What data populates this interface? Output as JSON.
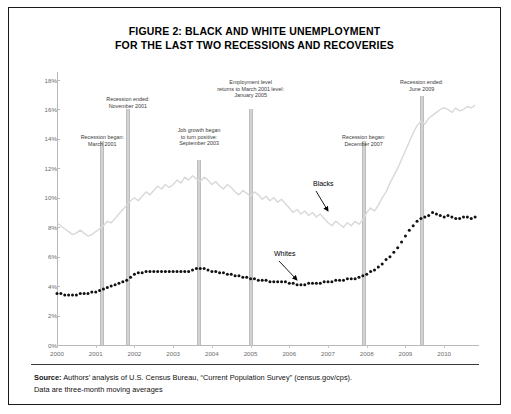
{
  "figure": {
    "title_line1": "FIGURE 2: BLACK AND WHITE UNEMPLOYMENT",
    "title_line2": "FOR THE LAST TWO RECESSIONS AND RECOVERIES",
    "source_label": "Source:",
    "source_text": " Authors’ analysis of U.S. Census Bureau, “Current Population Survey” (census.gov/cps).",
    "source_text_line2": "Data are three-month moving averages"
  },
  "annotations": [
    {
      "name": "recession-began-2001",
      "text_line1": "Recession began:",
      "text_line2": "March 2001",
      "x_year": 2001.17
    },
    {
      "name": "recession-ended-2001",
      "text_line1": "Recession ended:",
      "text_line2": "November 2001",
      "x_year": 2001.83
    },
    {
      "name": "job-growth-positive-2003",
      "text_line1": "Job growth began",
      "text_line2": "to turn positive:",
      "text_line3": "September 2003",
      "x_year": 2003.67
    },
    {
      "name": "employment-returns-2005",
      "text_line1": "Employment level",
      "text_line2": "returns to March 2001 level:",
      "text_line3": "January 2005",
      "x_year": 2005.0
    },
    {
      "name": "recession-began-2007",
      "text_line1": "Recession began:",
      "text_line2": "December 2007",
      "x_year": 2007.92
    },
    {
      "name": "recession-ended-2009",
      "text_line1": "Recession ended:",
      "text_line2": "June 2009",
      "x_year": 2009.42
    }
  ],
  "series_callouts": [
    {
      "name": "blacks",
      "label": "Blacks"
    },
    {
      "name": "whites",
      "label": "Whites"
    }
  ],
  "chart_data": {
    "type": "line",
    "title": "FIGURE 2: BLACK AND WHITE UNEMPLOYMENT FOR THE LAST TWO RECESSIONS AND RECOVERIES",
    "xlabel": "",
    "ylabel": "",
    "xlim": [
      2000,
      2010.9
    ],
    "ylim": [
      0,
      18
    ],
    "ytick_labels": [
      "0%",
      "2%",
      "4%",
      "6%",
      "8%",
      "10%",
      "12%",
      "14%",
      "16%",
      "18%"
    ],
    "ytick_values": [
      0,
      2,
      4,
      6,
      8,
      10,
      12,
      14,
      16,
      18
    ],
    "xtick_labels": [
      "2000",
      "2001",
      "2002",
      "2003",
      "2004",
      "2005",
      "2006",
      "2007",
      "2008",
      "2009",
      "2010"
    ],
    "xtick_values": [
      2000,
      2001,
      2002,
      2003,
      2004,
      2005,
      2006,
      2007,
      2008,
      2009,
      2010
    ],
    "grid": false,
    "legend_position": "inline-callout",
    "colors": {
      "blacks": "#d8d8d8",
      "whites": "#111111",
      "event_bar": "#d2d2d2",
      "axis": "#b9b9b9"
    },
    "series": [
      {
        "name": "Blacks",
        "color": "#d8d8d8",
        "style": "line",
        "x": [
          2000.0,
          2000.1,
          2000.2,
          2000.3,
          2000.4,
          2000.5,
          2000.6,
          2000.7,
          2000.8,
          2000.9,
          2001.0,
          2001.1,
          2001.2,
          2001.3,
          2001.4,
          2001.5,
          2001.6,
          2001.7,
          2001.8,
          2001.9,
          2002.0,
          2002.1,
          2002.2,
          2002.3,
          2002.4,
          2002.5,
          2002.6,
          2002.7,
          2002.8,
          2002.9,
          2003.0,
          2003.1,
          2003.2,
          2003.3,
          2003.4,
          2003.5,
          2003.6,
          2003.7,
          2003.8,
          2003.9,
          2004.0,
          2004.1,
          2004.2,
          2004.3,
          2004.4,
          2004.5,
          2004.6,
          2004.7,
          2004.8,
          2004.9,
          2005.0,
          2005.1,
          2005.2,
          2005.3,
          2005.4,
          2005.5,
          2005.6,
          2005.7,
          2005.8,
          2005.9,
          2006.0,
          2006.1,
          2006.2,
          2006.3,
          2006.4,
          2006.5,
          2006.6,
          2006.7,
          2006.8,
          2006.9,
          2007.0,
          2007.1,
          2007.2,
          2007.3,
          2007.4,
          2007.5,
          2007.6,
          2007.7,
          2007.8,
          2007.9,
          2008.0,
          2008.1,
          2008.2,
          2008.3,
          2008.4,
          2008.5,
          2008.6,
          2008.7,
          2008.8,
          2008.9,
          2009.0,
          2009.1,
          2009.2,
          2009.3,
          2009.4,
          2009.5,
          2009.6,
          2009.7,
          2009.8,
          2009.9,
          2010.0,
          2010.1,
          2010.2,
          2010.3,
          2010.4,
          2010.5,
          2010.6,
          2010.7,
          2010.8
        ],
        "y": [
          8.3,
          8.1,
          7.9,
          7.7,
          7.5,
          7.6,
          7.8,
          7.6,
          7.4,
          7.5,
          7.7,
          7.9,
          8.1,
          8.4,
          8.3,
          8.6,
          8.9,
          9.2,
          9.5,
          9.8,
          10.0,
          9.8,
          10.1,
          10.4,
          10.2,
          10.5,
          10.8,
          10.6,
          10.9,
          10.7,
          10.9,
          11.2,
          11.0,
          11.4,
          11.2,
          11.5,
          11.3,
          11.1,
          11.4,
          11.2,
          10.9,
          11.1,
          10.8,
          10.6,
          10.9,
          10.7,
          10.4,
          10.2,
          10.5,
          10.3,
          10.1,
          10.4,
          10.2,
          9.9,
          10.1,
          9.8,
          10.0,
          9.7,
          9.9,
          9.6,
          9.3,
          9.0,
          9.2,
          8.9,
          9.1,
          8.8,
          9.0,
          8.7,
          8.9,
          8.6,
          8.3,
          8.1,
          8.4,
          8.2,
          8.0,
          8.3,
          8.1,
          8.4,
          8.2,
          8.5,
          9.0,
          9.3,
          9.1,
          9.5,
          10.0,
          10.4,
          11.0,
          11.5,
          12.0,
          12.6,
          13.2,
          13.8,
          14.4,
          14.9,
          15.2,
          15.0,
          15.4,
          15.6,
          15.8,
          16.0,
          16.1,
          16.0,
          15.8,
          16.1,
          15.9,
          16.0,
          16.2,
          16.1,
          16.3
        ]
      },
      {
        "name": "Whites",
        "color": "#111111",
        "style": "dotted",
        "x": [
          2000.0,
          2000.1,
          2000.2,
          2000.3,
          2000.4,
          2000.5,
          2000.6,
          2000.7,
          2000.8,
          2000.9,
          2001.0,
          2001.1,
          2001.2,
          2001.3,
          2001.4,
          2001.5,
          2001.6,
          2001.7,
          2001.8,
          2001.9,
          2002.0,
          2002.1,
          2002.2,
          2002.3,
          2002.4,
          2002.5,
          2002.6,
          2002.7,
          2002.8,
          2002.9,
          2003.0,
          2003.1,
          2003.2,
          2003.3,
          2003.4,
          2003.5,
          2003.6,
          2003.7,
          2003.8,
          2003.9,
          2004.0,
          2004.1,
          2004.2,
          2004.3,
          2004.4,
          2004.5,
          2004.6,
          2004.7,
          2004.8,
          2004.9,
          2005.0,
          2005.1,
          2005.2,
          2005.3,
          2005.4,
          2005.5,
          2005.6,
          2005.7,
          2005.8,
          2005.9,
          2006.0,
          2006.1,
          2006.2,
          2006.3,
          2006.4,
          2006.5,
          2006.6,
          2006.7,
          2006.8,
          2006.9,
          2007.0,
          2007.1,
          2007.2,
          2007.3,
          2007.4,
          2007.5,
          2007.6,
          2007.7,
          2007.8,
          2007.9,
          2008.0,
          2008.1,
          2008.2,
          2008.3,
          2008.4,
          2008.5,
          2008.6,
          2008.7,
          2008.8,
          2008.9,
          2009.0,
          2009.1,
          2009.2,
          2009.3,
          2009.4,
          2009.5,
          2009.6,
          2009.7,
          2009.8,
          2009.9,
          2010.0,
          2010.1,
          2010.2,
          2010.3,
          2010.4,
          2010.5,
          2010.6,
          2010.7,
          2010.8
        ],
        "y": [
          3.5,
          3.5,
          3.4,
          3.4,
          3.4,
          3.4,
          3.5,
          3.5,
          3.5,
          3.6,
          3.6,
          3.7,
          3.8,
          3.9,
          4.0,
          4.1,
          4.2,
          4.3,
          4.4,
          4.6,
          4.8,
          4.9,
          4.9,
          5.0,
          5.0,
          5.0,
          5.0,
          5.0,
          5.0,
          5.0,
          5.0,
          5.0,
          5.0,
          5.0,
          5.0,
          5.1,
          5.2,
          5.2,
          5.2,
          5.1,
          5.0,
          5.0,
          4.9,
          4.9,
          4.8,
          4.8,
          4.7,
          4.7,
          4.6,
          4.6,
          4.5,
          4.5,
          4.4,
          4.4,
          4.4,
          4.3,
          4.3,
          4.3,
          4.3,
          4.3,
          4.2,
          4.2,
          4.1,
          4.1,
          4.1,
          4.2,
          4.2,
          4.2,
          4.2,
          4.3,
          4.3,
          4.3,
          4.4,
          4.4,
          4.4,
          4.5,
          4.5,
          4.5,
          4.6,
          4.7,
          4.8,
          5.0,
          5.1,
          5.3,
          5.5,
          5.8,
          6.0,
          6.3,
          6.6,
          7.0,
          7.4,
          7.8,
          8.1,
          8.4,
          8.6,
          8.7,
          8.8,
          9.0,
          8.9,
          8.8,
          8.7,
          8.8,
          8.7,
          8.6,
          8.6,
          8.7,
          8.7,
          8.6,
          8.7
        ]
      }
    ]
  }
}
